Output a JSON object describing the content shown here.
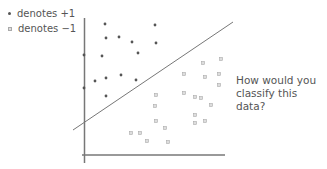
{
  "legend": {
    "items": [
      {
        "marker": "filled-dot",
        "label": "denotes +1"
      },
      {
        "marker": "hollow-square",
        "label": "denotes −1"
      }
    ]
  },
  "question": {
    "line1": "How would you",
    "line2": "classify this data?"
  },
  "colors": {
    "axis": "#777777",
    "line": "#777777",
    "positive": "#555555",
    "negative_fill": "#dddddd",
    "negative_stroke": "#aaaaaa",
    "text": "#555555"
  },
  "axes": {
    "y_axis": {
      "x": 84.5,
      "y1": 18,
      "y2": 163
    },
    "x_axis": {
      "y": 155,
      "x1": 82,
      "x2": 225
    }
  },
  "separator_line": {
    "x1": 73,
    "y1": 130,
    "x2": 233,
    "y2": 22
  },
  "points": {
    "positive": [
      [
        105,
        24
      ],
      [
        155,
        25
      ],
      [
        106,
        38
      ],
      [
        119,
        37
      ],
      [
        132,
        42
      ],
      [
        156,
        43
      ],
      [
        84,
        55
      ],
      [
        102,
        56
      ],
      [
        138,
        53
      ],
      [
        95,
        81
      ],
      [
        106,
        78
      ],
      [
        121,
        75
      ],
      [
        136,
        80
      ],
      [
        106,
        96
      ],
      [
        84,
        88
      ]
    ],
    "negative": [
      [
        203,
        63
      ],
      [
        221,
        59
      ],
      [
        219,
        74
      ],
      [
        219,
        85
      ],
      [
        184,
        74
      ],
      [
        205,
        77
      ],
      [
        156,
        95
      ],
      [
        155,
        106
      ],
      [
        195,
        97
      ],
      [
        201,
        98
      ],
      [
        211,
        105
      ],
      [
        156,
        121
      ],
      [
        195,
        115
      ],
      [
        195,
        123
      ],
      [
        205,
        121
      ],
      [
        131,
        133
      ],
      [
        140,
        133
      ],
      [
        147,
        141
      ],
      [
        168,
        142
      ],
      [
        184,
        93
      ],
      [
        165,
        128
      ]
    ]
  }
}
